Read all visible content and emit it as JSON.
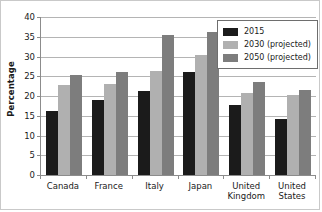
{
  "chart_data": {
    "type": "bar",
    "title": "",
    "xlabel": "",
    "ylabel": "Percentage",
    "ylim": [
      0,
      40
    ],
    "yticks": [
      0,
      5,
      10,
      15,
      20,
      25,
      30,
      35,
      40
    ],
    "ytick_labels": [
      "0",
      "5",
      "10",
      "15",
      "20",
      "25",
      "30",
      "35",
      "40"
    ],
    "grid": "horizontal",
    "legend_position": "upper-right",
    "categories": [
      "Canada",
      "France",
      "Italy",
      "Japan",
      "United Kingdom",
      "United States"
    ],
    "category_lines": [
      [
        "Canada"
      ],
      [
        "France"
      ],
      [
        "Italy"
      ],
      [
        "Japan"
      ],
      [
        "United",
        "Kingdom"
      ],
      [
        "United",
        "States"
      ]
    ],
    "series": [
      {
        "name": "2015",
        "color": "#1b1b1b",
        "values": [
          16.1,
          19.0,
          21.2,
          26.0,
          17.7,
          14.3
        ]
      },
      {
        "name": "2030 (projected)",
        "color": "#b0b0b0",
        "values": [
          22.9,
          23.0,
          26.3,
          30.5,
          20.8,
          20.2
        ]
      },
      {
        "name": "2050 (projected)",
        "color": "#7d7d7d",
        "values": [
          25.4,
          26.0,
          35.5,
          36.3,
          23.5,
          21.6
        ]
      }
    ]
  },
  "legend": {
    "entries": [
      "2015",
      "2030 (projected)",
      "2050 (projected)"
    ]
  }
}
